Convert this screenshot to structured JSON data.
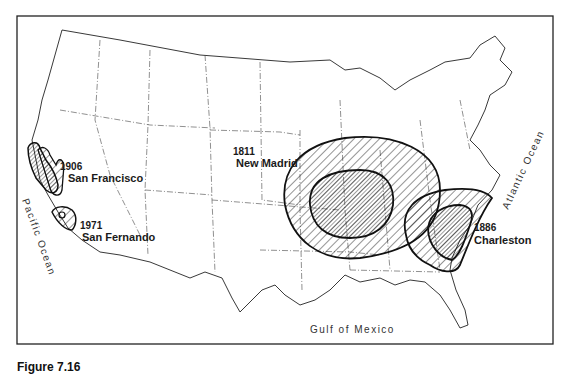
{
  "map": {
    "title": "Major U.S. earthquakes — zones of damage",
    "frame": {
      "x": 17,
      "y": 16,
      "width": 536,
      "height": 328
    },
    "earthquakes": [
      {
        "year": "1906",
        "name": "San Francisco"
      },
      {
        "year": "1971",
        "name": "San Fernando"
      },
      {
        "year": "1811",
        "name": "New Madrid"
      },
      {
        "year": "1886",
        "name": "Charleston"
      }
    ],
    "water_labels": {
      "pacific": "Pacific Ocean",
      "atlantic": "Atlantic Ocean",
      "gulf": "Gulf of Mexico"
    },
    "legend_hint": {
      "outer_zone": "wide hatching — area of felt damage",
      "inner_zone": "dense hatching — area of heavy damage"
    },
    "colors": {
      "line": "#111111",
      "background": "#ffffff",
      "state_line": "#444444"
    }
  },
  "caption": {
    "text": "Figure 7.16"
  }
}
